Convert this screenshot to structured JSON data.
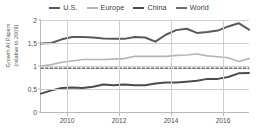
{
  "chart_data": {
    "type": "line",
    "title": "",
    "xlabel": "",
    "ylabel": "Growth AI Papers\n(relative to 2009)",
    "ylabel_line1": "Growth AI Papers",
    "ylabel_line2": "(relative to 2009)",
    "ylim": [
      0,
      2
    ],
    "xlim": [
      2009,
      2017
    ],
    "yticks": [
      "0",
      "0,5",
      "1",
      "1,5",
      "2"
    ],
    "ytick_values": [
      0,
      0.5,
      1,
      1.5,
      2
    ],
    "xticks": [
      "2010",
      "2012",
      "2014",
      "2016"
    ],
    "xtick_values": [
      2010,
      2012,
      2014,
      2016
    ],
    "grid": "horizontal-and-vertical",
    "legend_position": "top-center",
    "x": [
      2009,
      2009.4,
      2009.8,
      2010.2,
      2010.6,
      2011,
      2011.4,
      2011.8,
      2012.2,
      2012.6,
      2013,
      2013.4,
      2013.8,
      2014.2,
      2014.6,
      2015,
      2015.4,
      2015.8,
      2016.2,
      2016.6,
      2017
    ],
    "series": [
      {
        "name": "U.S.",
        "color": "#5a5a5a",
        "width": 2.0,
        "dashed": false,
        "values": [
          1.49,
          1.5,
          1.58,
          1.63,
          1.63,
          1.62,
          1.6,
          1.59,
          1.59,
          1.63,
          1.62,
          1.53,
          1.68,
          1.78,
          1.81,
          1.72,
          1.74,
          1.77,
          1.86,
          1.93,
          1.79
        ]
      },
      {
        "name": "Europe",
        "color": "#b5b5b5",
        "width": 1.6,
        "dashed": false,
        "values": [
          1.0,
          1.03,
          1.08,
          1.11,
          1.14,
          1.14,
          1.14,
          1.15,
          1.16,
          1.21,
          1.21,
          1.21,
          1.21,
          1.23,
          1.24,
          1.26,
          1.22,
          1.2,
          1.18,
          1.1,
          1.16
        ]
      },
      {
        "name": "China",
        "color": "#4c4c4c",
        "width": 2.0,
        "dashed": false,
        "values": [
          0.4,
          0.47,
          0.52,
          0.53,
          0.52,
          0.55,
          0.6,
          0.58,
          0.6,
          0.58,
          0.58,
          0.62,
          0.64,
          0.64,
          0.66,
          0.68,
          0.72,
          0.72,
          0.76,
          0.84,
          0.85
        ]
      },
      {
        "name": "World",
        "color": "#6e6e6e",
        "width": 1.5,
        "dashed": true,
        "values": [
          0.95,
          0.95,
          0.95,
          0.95,
          0.95,
          0.95,
          0.95,
          0.95,
          0.95,
          0.95,
          0.95,
          0.95,
          0.95,
          0.95,
          0.95,
          0.95,
          0.95,
          0.95,
          0.95,
          0.95,
          0.95
        ]
      }
    ]
  }
}
